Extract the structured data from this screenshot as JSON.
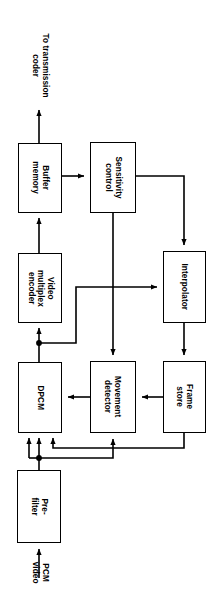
{
  "diagram": {
    "orientation": "rotated-90-clockwise",
    "stroke_color": "#000000",
    "background_color": "#ffffff",
    "nodes": [
      {
        "id": "buffer_memory",
        "label": "Buffer\nmemory"
      },
      {
        "id": "sensitivity_control",
        "label": "Sensitivity\ncontrol"
      },
      {
        "id": "video_mux_encoder",
        "label": "Video\nmultiplex\nencoder"
      },
      {
        "id": "interpolator",
        "label": "Interpolator"
      },
      {
        "id": "dpcm",
        "label": "DPCM"
      },
      {
        "id": "movement_detector",
        "label": "Movement\ndetector"
      },
      {
        "id": "frame_store",
        "label": "Frame\nstore"
      },
      {
        "id": "pre_filter",
        "label": "Pre-\nfilter"
      }
    ],
    "free_labels": [
      {
        "id": "output_label",
        "label": "To transmission\ncoder"
      },
      {
        "id": "input_label",
        "label": "PCM\nvideo"
      }
    ]
  }
}
